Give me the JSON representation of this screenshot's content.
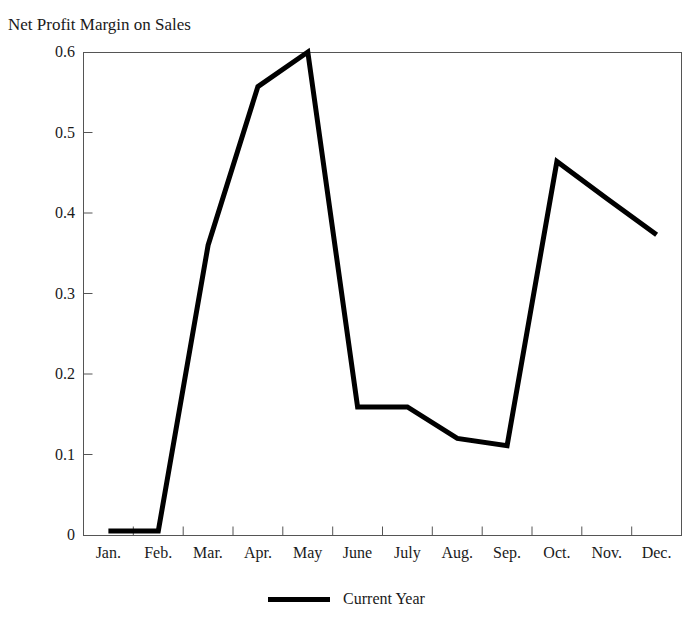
{
  "chart_data": {
    "type": "line",
    "title": "Net Profit Margin on Sales",
    "xlabel": "",
    "ylabel": "",
    "categories": [
      "Jan.",
      "Feb.",
      "Mar.",
      "Apr.",
      "May",
      "June",
      "July",
      "Aug.",
      "Sep.",
      "Oct.",
      "Nov.",
      "Dec."
    ],
    "series": [
      {
        "name": "Current Year",
        "color": "#000000",
        "values": [
          0.005,
          0.005,
          0.36,
          0.557,
          0.6,
          0.159,
          0.159,
          0.12,
          0.111,
          0.464,
          0.418,
          0.373
        ]
      }
    ],
    "ylim": [
      0,
      0.6
    ],
    "yticks": [
      0,
      0.1,
      0.2,
      0.3,
      0.4,
      0.5,
      0.6
    ],
    "ytick_labels": [
      "0",
      "0.1",
      "0.2",
      "0.3",
      "0.4",
      "0.5",
      "0.6"
    ],
    "grid": false,
    "legend_position": "bottom",
    "legend_entries": [
      "Current Year"
    ],
    "axis_color": "#555555",
    "line_width": 5
  },
  "legend": {
    "label": "Current Year"
  }
}
